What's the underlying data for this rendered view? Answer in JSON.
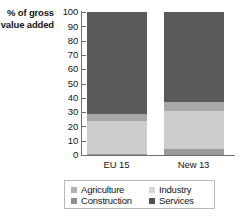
{
  "chart_data": {
    "type": "bar",
    "title": "",
    "subtitle": "",
    "xlabel": "",
    "ylabel": "% of gross value added",
    "ylabel_lines": [
      "% of gross",
      "value added"
    ],
    "categories": [
      "EU 15",
      "New 13"
    ],
    "ylim": [
      0,
      100
    ],
    "ytick_labels": [
      "100",
      "90",
      "80",
      "70",
      "60",
      "50",
      "40",
      "30",
      "20",
      "10",
      "0"
    ],
    "ytick_values": [
      100,
      90,
      80,
      70,
      60,
      50,
      40,
      30,
      20,
      10,
      0
    ],
    "grid": false,
    "stacked": true,
    "stack_order_bottom_to_top": [
      "Agriculture",
      "Industry",
      "Construction",
      "Services"
    ],
    "legend_position": "bottom",
    "series": [
      {
        "name": "Agriculture",
        "values": [
          1,
          4
        ],
        "color": "#9a9a9a"
      },
      {
        "name": "Industry",
        "values": [
          23,
          27
        ],
        "color": "#cdcdcd"
      },
      {
        "name": "Construction",
        "values": [
          5,
          6
        ],
        "color": "#a8a8a8"
      },
      {
        "name": "Services",
        "values": [
          71,
          63
        ],
        "color": "#5a5a5a"
      }
    ]
  },
  "legend": {
    "entries": [
      {
        "label": "Agriculture",
        "color": "#b0b0b0"
      },
      {
        "label": "Industry",
        "color": "#d6d6d6"
      },
      {
        "label": "Construction",
        "color": "#8e8e8e"
      },
      {
        "label": "Services",
        "color": "#4f4f4f"
      }
    ]
  },
  "colors": {
    "axis": "#6e6e6e",
    "text": "#151515",
    "legend_border": "#b9b9b9",
    "background": "#ffffff"
  }
}
